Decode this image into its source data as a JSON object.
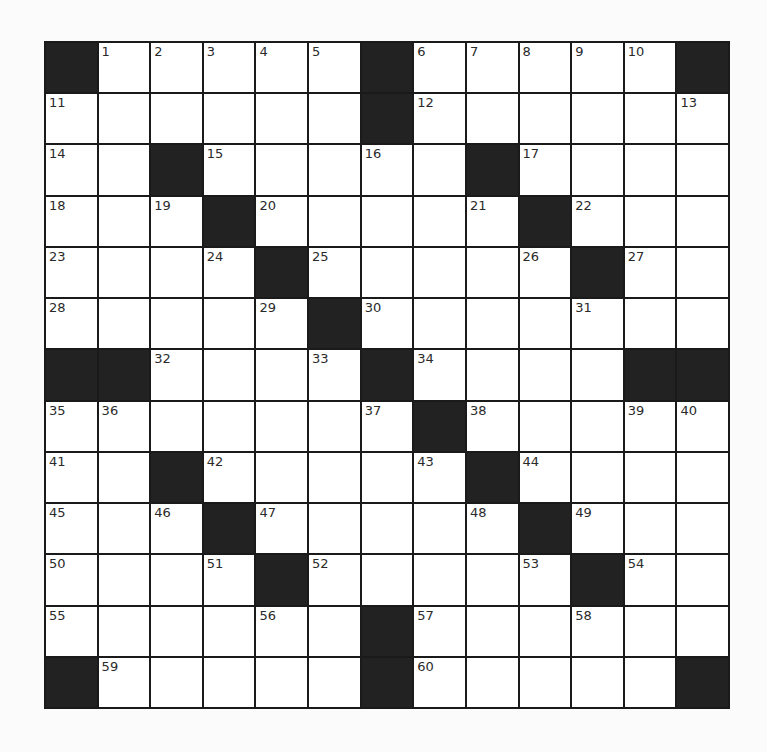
{
  "puzzle": {
    "rows": 13,
    "cols": 13,
    "colors": {
      "block": "#222222",
      "cell": "#ffffff",
      "grid_line": "#1a1a1a"
    },
    "grid": [
      [
        "#",
        "1",
        "2",
        "3",
        "4",
        "5",
        "#",
        "6",
        "7",
        "8",
        "9",
        "10",
        "#"
      ],
      [
        "11",
        "",
        "",
        "",
        "",
        "",
        "#",
        "12",
        "",
        "",
        "",
        "",
        "13"
      ],
      [
        "14",
        "",
        "#",
        "15",
        "",
        "",
        "16",
        "",
        "#",
        "17",
        "",
        "",
        ""
      ],
      [
        "18",
        "",
        "19",
        "#",
        "20",
        "",
        "",
        "",
        "21",
        "#",
        "22",
        "",
        ""
      ],
      [
        "23",
        "",
        "",
        "24",
        "#",
        "25",
        "",
        "",
        "",
        "26",
        "#",
        "27",
        ""
      ],
      [
        "28",
        "",
        "",
        "",
        "29",
        "#",
        "30",
        "",
        "",
        "",
        "31",
        "",
        ""
      ],
      [
        "#",
        "#",
        "32",
        "",
        "",
        "33",
        "#",
        "34",
        "",
        "",
        "",
        "#",
        "#"
      ],
      [
        "35",
        "36",
        "",
        "",
        "",
        "",
        "37",
        "#",
        "38",
        "",
        "",
        "39",
        "40"
      ],
      [
        "41",
        "",
        "#",
        "42",
        "",
        "",
        "",
        "43",
        "#",
        "44",
        "",
        "",
        ""
      ],
      [
        "45",
        "",
        "46",
        "#",
        "47",
        "",
        "",
        "",
        "48",
        "#",
        "49",
        "",
        ""
      ],
      [
        "50",
        "",
        "",
        "51",
        "#",
        "52",
        "",
        "",
        "",
        "53",
        "#",
        "54",
        ""
      ],
      [
        "55",
        "",
        "",
        "",
        "56",
        "",
        "#",
        "57",
        "",
        "",
        "58",
        "",
        ""
      ],
      [
        "#",
        "59",
        "",
        "",
        "",
        "",
        "#",
        "60",
        "",
        "",
        "",
        "",
        "#"
      ]
    ]
  }
}
